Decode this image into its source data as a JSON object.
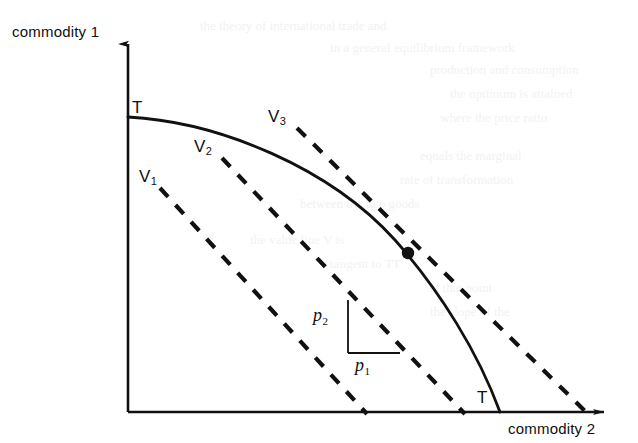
{
  "figure": {
    "background_color": "#ffffff",
    "ink_color": "#111111",
    "bleed_color": "#f2f2f2"
  },
  "axes": {
    "x_label": "commodity 2",
    "y_label": "commodity 1",
    "origin": [
      128,
      412
    ],
    "x_axis_end": [
      612,
      412
    ],
    "y_axis_top": [
      128,
      38
    ],
    "arrow_heads": true,
    "ticks": false,
    "grid": false
  },
  "curve": {
    "name": "transformation-curve",
    "label_start": "T",
    "label_end": "T",
    "style": "solid",
    "y_intercept": [
      128,
      117
    ],
    "x_intercept": [
      500,
      412
    ]
  },
  "iso_value_lines": [
    {
      "id": "V1",
      "label": "V",
      "subscript": "1",
      "style": "dashed",
      "label_pos": [
        143,
        170
      ],
      "start": [
        160,
        188
      ],
      "end": [
        367,
        412
      ]
    },
    {
      "id": "V2",
      "label": "V",
      "subscript": "2",
      "style": "dashed",
      "label_pos": [
        198,
        140
      ],
      "start": [
        222,
        158
      ],
      "end": [
        465,
        412
      ]
    },
    {
      "id": "V3",
      "label": "V",
      "subscript": "3",
      "style": "dashed",
      "label_pos": [
        272,
        110
      ],
      "start": [
        297,
        128
      ],
      "end": [
        585,
        412
      ]
    }
  ],
  "optimum_point": {
    "name": "tangency-point",
    "marker": "filled-circle",
    "position": [
      408,
      253
    ]
  },
  "slope_triangle": {
    "vertical_leg_label": "p",
    "vertical_leg_subscript": "2",
    "horizontal_leg_label": "p",
    "horizontal_leg_subscript": "1",
    "corner": [
      348,
      353
    ],
    "vertical_top": [
      348,
      300
    ],
    "horizontal_right": [
      399,
      353
    ],
    "p2_label_pos": [
      314,
      307
    ],
    "p1_label_pos": [
      357,
      357
    ]
  },
  "chart_data": {
    "type": "line",
    "title": "",
    "xlabel": "commodity 2",
    "ylabel": "commodity 1",
    "grid": false,
    "legend": "inline-labels",
    "series": [
      {
        "name": "TT transformation curve",
        "style": "solid",
        "points": [
          [
            0,
            1.0
          ],
          [
            0.1,
            0.995
          ],
          [
            0.2,
            0.977
          ],
          [
            0.3,
            0.945
          ],
          [
            0.4,
            0.898
          ],
          [
            0.5,
            0.833
          ],
          [
            0.6,
            0.75
          ],
          [
            0.7,
            0.64
          ],
          [
            0.8,
            0.5
          ],
          [
            0.9,
            0.31
          ],
          [
            1.0,
            0.0
          ]
        ]
      },
      {
        "name": "V1",
        "style": "dashed",
        "points": [
          [
            0.086,
            0.76
          ],
          [
            0.642,
            0.0
          ]
        ]
      },
      {
        "name": "V2",
        "style": "dashed",
        "points": [
          [
            0.253,
            0.861
          ],
          [
            0.905,
            0.0
          ]
        ]
      },
      {
        "name": "V3",
        "style": "dashed",
        "points": [
          [
            0.454,
            0.963
          ],
          [
            1.228,
            0.0
          ]
        ]
      }
    ],
    "annotations": [
      {
        "text": "T",
        "x": 0.02,
        "y": 1.0
      },
      {
        "text": "T",
        "x": 0.95,
        "y": 0.04
      },
      {
        "text": "V1",
        "x": 0.04,
        "y": 0.82
      },
      {
        "text": "V2",
        "x": 0.19,
        "y": 0.9
      },
      {
        "text": "V3",
        "x": 0.39,
        "y": 0.99
      },
      {
        "text": "tangency point",
        "x": 0.752,
        "y": 0.575
      }
    ]
  },
  "bleed_text": [
    {
      "text": "the theory of international trade and",
      "x": 200,
      "y": 18
    },
    {
      "text": "in a general equilibrium framework",
      "x": 330,
      "y": 40
    },
    {
      "text": "production and consumption",
      "x": 430,
      "y": 62
    },
    {
      "text": "the optimum is attained",
      "x": 450,
      "y": 86
    },
    {
      "text": "where the price ratio",
      "x": 440,
      "y": 110
    },
    {
      "text": "equals the marginal",
      "x": 420,
      "y": 148
    },
    {
      "text": "rate of transformation",
      "x": 400,
      "y": 172
    },
    {
      "text": "between the two goods",
      "x": 300,
      "y": 196
    },
    {
      "text": "the value line V is",
      "x": 250,
      "y": 232
    },
    {
      "text": "tangent to TT",
      "x": 330,
      "y": 256
    },
    {
      "text": "at that point",
      "x": 430,
      "y": 280
    },
    {
      "text": "the slope of the",
      "x": 430,
      "y": 304
    }
  ]
}
